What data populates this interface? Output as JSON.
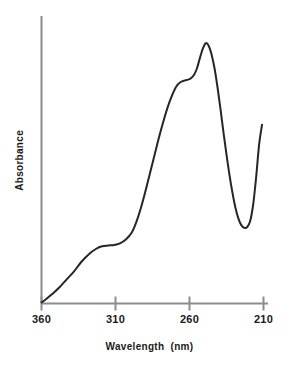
{
  "chart_data": {
    "type": "line",
    "title": "",
    "xlabel": "Wavelength  (nm)",
    "ylabel": "Absorbance",
    "xlim": [
      360,
      210
    ],
    "ylim": [
      0,
      1
    ],
    "x_reversed": true,
    "grid": false,
    "legend": null,
    "xticks": [
      {
        "value": 360,
        "label": "360"
      },
      {
        "value": 310,
        "label": "310"
      },
      {
        "value": 260,
        "label": "260"
      },
      {
        "value": 210,
        "label": "210"
      }
    ],
    "yticks": [],
    "series": [
      {
        "name": "Absorbance spectrum",
        "color": "#262626",
        "x": [
          360,
          357,
          353,
          348,
          343,
          338,
          333,
          328,
          323,
          319,
          315,
          311,
          307,
          303,
          299,
          296,
          293,
          290,
          287,
          284,
          281,
          278,
          275,
          272,
          269,
          266,
          263,
          261,
          259,
          257,
          255,
          253,
          251,
          249,
          247,
          245,
          243,
          241,
          239,
          237,
          235,
          233,
          231,
          229,
          227,
          225,
          223,
          221,
          219,
          217,
          215,
          213,
          211
        ],
        "y": [
          0.0,
          0.012,
          0.03,
          0.055,
          0.085,
          0.115,
          0.15,
          0.178,
          0.198,
          0.207,
          0.21,
          0.212,
          0.218,
          0.232,
          0.258,
          0.295,
          0.345,
          0.405,
          0.47,
          0.535,
          0.6,
          0.66,
          0.715,
          0.76,
          0.795,
          0.812,
          0.818,
          0.821,
          0.826,
          0.838,
          0.862,
          0.9,
          0.935,
          0.955,
          0.945,
          0.912,
          0.86,
          0.79,
          0.71,
          0.625,
          0.545,
          0.47,
          0.405,
          0.35,
          0.31,
          0.285,
          0.275,
          0.278,
          0.3,
          0.36,
          0.46,
          0.58,
          0.655
        ]
      }
    ],
    "annotations": {
      "shoulder_1_nm": 312,
      "shoulder_2_nm": 259,
      "peak_nm": 249,
      "valley_nm": 222,
      "right_edge_nm": 211
    },
    "axis_color": "#8c8c8c",
    "curve_color": "#262626",
    "background": "#ffffff"
  }
}
